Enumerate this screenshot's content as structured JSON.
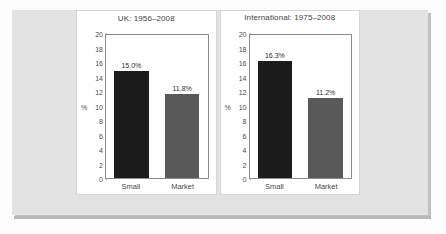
{
  "chart_data": [
    {
      "type": "bar",
      "title": "UK: 1956–2008",
      "categories": [
        "Small",
        "Market"
      ],
      "values": [
        15.0,
        11.8
      ],
      "data_labels": [
        "15.0%",
        "11.8%"
      ],
      "bar_colors": [
        "#1c1c1c",
        "#595959"
      ],
      "xlabel": "",
      "ylabel": "%",
      "ylim": [
        0,
        20
      ],
      "yticks": [
        20,
        18,
        16,
        14,
        12,
        10,
        8,
        6,
        4,
        2,
        0
      ],
      "grid": false,
      "legend": false
    },
    {
      "type": "bar",
      "title": "International: 1975–2008",
      "categories": [
        "Small",
        "Market"
      ],
      "values": [
        16.3,
        11.2
      ],
      "data_labels": [
        "16.3%",
        "11.2%"
      ],
      "bar_colors": [
        "#1c1c1c",
        "#595959"
      ],
      "xlabel": "",
      "ylabel": "%",
      "ylim": [
        0,
        20
      ],
      "yticks": [
        20,
        18,
        16,
        14,
        12,
        10,
        8,
        6,
        4,
        2,
        0
      ],
      "grid": false,
      "legend": false
    }
  ],
  "colors": {
    "panel_background": "#e3e3e3",
    "card_background": "#ffffff",
    "series_primary": "#1c1c1c",
    "series_secondary": "#595959",
    "axis": "#8d8d8d",
    "text": "#4a4a4a"
  }
}
